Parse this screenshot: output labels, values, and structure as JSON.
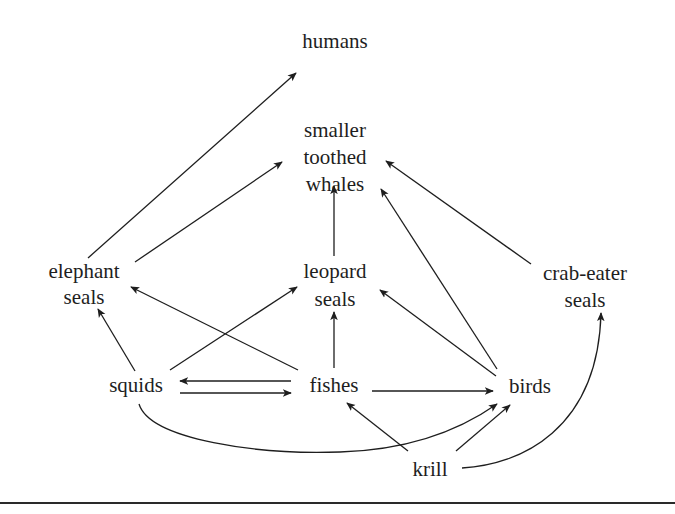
{
  "diagram": {
    "type": "food-web",
    "colors": {
      "ink": "#1e1e1e",
      "background": "#ffffff"
    },
    "nodes": {
      "humans": {
        "lines": [
          "humans"
        ]
      },
      "whales": {
        "lines": [
          "smaller",
          "toothed",
          "whales"
        ]
      },
      "elephant_seals": {
        "lines": [
          "elephant",
          "seals"
        ]
      },
      "leopard_seals": {
        "lines": [
          "leopard",
          "seals"
        ]
      },
      "crab_eater_seals": {
        "lines": [
          "crab-eater",
          "seals"
        ]
      },
      "squids": {
        "lines": [
          "squids"
        ]
      },
      "fishes": {
        "lines": [
          "fishes"
        ]
      },
      "birds": {
        "lines": [
          "birds"
        ]
      },
      "krill": {
        "lines": [
          "krill"
        ]
      }
    },
    "edges": [
      {
        "from": "elephant seals",
        "to": "humans"
      },
      {
        "from": "elephant seals",
        "to": "smaller toothed whales"
      },
      {
        "from": "leopard seals",
        "to": "smaller toothed whales"
      },
      {
        "from": "birds",
        "to": "smaller toothed whales"
      },
      {
        "from": "crab-eater seals",
        "to": "smaller toothed whales"
      },
      {
        "from": "squids",
        "to": "elephant seals"
      },
      {
        "from": "fishes",
        "to": "elephant seals"
      },
      {
        "from": "squids",
        "to": "leopard seals"
      },
      {
        "from": "fishes",
        "to": "leopard seals"
      },
      {
        "from": "birds",
        "to": "leopard seals"
      },
      {
        "from": "fishes",
        "to": "squids"
      },
      {
        "from": "squids",
        "to": "fishes"
      },
      {
        "from": "fishes",
        "to": "birds"
      },
      {
        "from": "squids",
        "to": "birds"
      },
      {
        "from": "krill",
        "to": "fishes"
      },
      {
        "from": "krill",
        "to": "birds"
      },
      {
        "from": "krill",
        "to": "crab-eater seals"
      }
    ]
  }
}
